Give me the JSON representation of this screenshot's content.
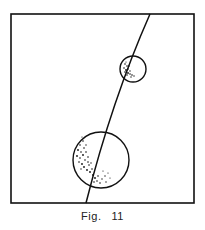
{
  "figure": {
    "caption_prefix": "Fig.",
    "caption_number": "11"
  },
  "diagram": {
    "frame": {
      "x": 11,
      "y": 14,
      "width": 183,
      "height": 189
    },
    "curve": {
      "description": "arc line crossing frame from top-right to bottom"
    },
    "circles": [
      {
        "name": "small-circle",
        "cx": 133,
        "cy": 69,
        "r": 13,
        "stippled": true
      },
      {
        "name": "large-circle",
        "cx": 101,
        "cy": 160,
        "r": 29,
        "stippled": true
      }
    ],
    "stroke_color": "#111111"
  }
}
